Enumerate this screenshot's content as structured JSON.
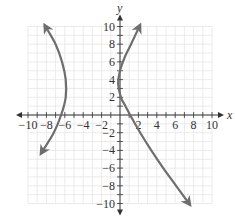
{
  "chart_data": {
    "type": "line",
    "title": "",
    "xlabel": "x",
    "ylabel": "y",
    "xlim": [
      -10,
      10
    ],
    "ylim": [
      -10,
      10
    ],
    "grid": true,
    "grid_step": 1,
    "x_ticks": [
      -10,
      -8,
      -6,
      -4,
      -2,
      2,
      4,
      6,
      8,
      10
    ],
    "y_ticks": [
      -10,
      -8,
      -6,
      -4,
      -2,
      2,
      4,
      6,
      8,
      10
    ],
    "x_tick_labels": [
      "−10",
      "−8",
      "−6",
      "−4",
      "−2",
      "2",
      "4",
      "6",
      "8",
      "10"
    ],
    "y_tick_labels": [
      "−10",
      "−8",
      "−6",
      "−4",
      "−2",
      "2",
      "4",
      "6",
      "8",
      "10"
    ],
    "series": [
      {
        "name": "left-curve",
        "description": "sideways parabola opening left, arrows at both ends",
        "points": [
          [
            -8.1,
            10
          ],
          [
            -7.0,
            8
          ],
          [
            -6.3,
            6
          ],
          [
            -5.9,
            4
          ],
          [
            -5.9,
            2
          ],
          [
            -6.4,
            0
          ],
          [
            -7.2,
            -2
          ],
          [
            -8.5,
            -4.2
          ]
        ]
      },
      {
        "name": "right-curve",
        "description": "sideways curve opening right, arrows at both ends",
        "points": [
          [
            2.1,
            10
          ],
          [
            1.2,
            8
          ],
          [
            0.5,
            6.5
          ],
          [
            0.0,
            5
          ],
          [
            -0.2,
            3.5
          ],
          [
            0.1,
            2
          ],
          [
            0.6,
            1
          ],
          [
            1.1,
            0
          ],
          [
            2.2,
            -2
          ],
          [
            3.4,
            -4
          ],
          [
            4.7,
            -6
          ],
          [
            6.1,
            -8
          ],
          [
            7.5,
            -10
          ]
        ]
      }
    ],
    "colors": {
      "curve": "#6e6e6e",
      "axis": "#333333",
      "grid": "#e6e6e6"
    }
  }
}
